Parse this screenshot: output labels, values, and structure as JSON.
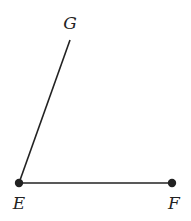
{
  "diagram": {
    "type": "angle",
    "colors": {
      "stroke": "#222222",
      "point": "#222222",
      "background": "#ffffff"
    },
    "points": {
      "E": {
        "label": "E",
        "x": 19,
        "y": 183,
        "label_x": 19,
        "label_y": 209
      },
      "F": {
        "label": "F",
        "x": 172,
        "y": 183,
        "label_x": 174,
        "label_y": 209
      },
      "G": {
        "label": "G",
        "x": 70,
        "y": 40,
        "label_x": 70,
        "label_y": 29
      }
    },
    "segments": [
      {
        "name": "EG",
        "from": "E",
        "to": "G"
      },
      {
        "name": "EF",
        "from": "E",
        "to": "F"
      }
    ]
  }
}
